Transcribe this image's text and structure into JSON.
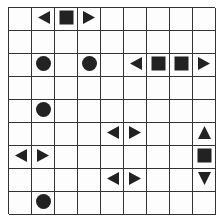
{
  "puzzle": {
    "type": "battleship",
    "rows": 9,
    "cols": 9,
    "colors": {
      "grid": "#333333",
      "piece": "#222222",
      "background": "#fdfdfd"
    },
    "pieces": [
      {
        "row": 0,
        "col": 1,
        "shape": "left-end"
      },
      {
        "row": 0,
        "col": 2,
        "shape": "middle"
      },
      {
        "row": 0,
        "col": 3,
        "shape": "right-end"
      },
      {
        "row": 2,
        "col": 1,
        "shape": "submarine"
      },
      {
        "row": 2,
        "col": 3,
        "shape": "submarine"
      },
      {
        "row": 2,
        "col": 5,
        "shape": "left-end"
      },
      {
        "row": 2,
        "col": 6,
        "shape": "middle"
      },
      {
        "row": 2,
        "col": 7,
        "shape": "middle"
      },
      {
        "row": 2,
        "col": 8,
        "shape": "right-end"
      },
      {
        "row": 4,
        "col": 1,
        "shape": "submarine"
      },
      {
        "row": 5,
        "col": 4,
        "shape": "left-end"
      },
      {
        "row": 5,
        "col": 5,
        "shape": "right-end"
      },
      {
        "row": 5,
        "col": 8,
        "shape": "top-end"
      },
      {
        "row": 6,
        "col": 0,
        "shape": "left-end"
      },
      {
        "row": 6,
        "col": 1,
        "shape": "right-end"
      },
      {
        "row": 6,
        "col": 8,
        "shape": "middle"
      },
      {
        "row": 7,
        "col": 4,
        "shape": "left-end"
      },
      {
        "row": 7,
        "col": 5,
        "shape": "right-end"
      },
      {
        "row": 7,
        "col": 8,
        "shape": "bottom-end"
      },
      {
        "row": 8,
        "col": 1,
        "shape": "submarine"
      }
    ]
  }
}
